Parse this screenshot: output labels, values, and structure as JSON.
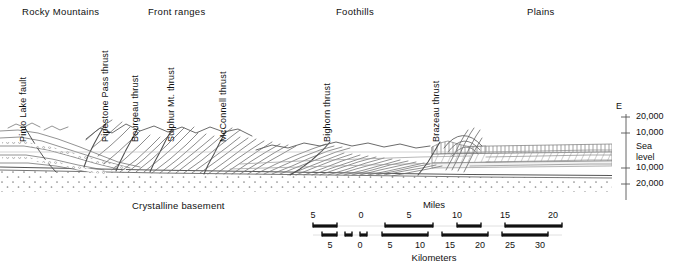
{
  "figure": {
    "type": "geological-cross-section",
    "title_regions": [
      {
        "label": "Rocky Mountains",
        "x": 22,
        "y": 6
      },
      {
        "label": "Front ranges",
        "x": 148,
        "y": 6
      },
      {
        "label": "Foothills",
        "x": 336,
        "y": 6
      },
      {
        "label": "Plains",
        "x": 527,
        "y": 6
      }
    ],
    "fault_labels": [
      {
        "label": "Pinto Lake fault",
        "x": 28,
        "y": 132
      },
      {
        "label": "Pipestone Pass thrust",
        "x": 110,
        "y": 132
      },
      {
        "label": "Bourgeau thrust",
        "x": 140,
        "y": 132
      },
      {
        "label": "Sulphur Mt. thrust",
        "x": 176,
        "y": 132
      },
      {
        "label": "McConnell thrust",
        "x": 228,
        "y": 132
      },
      {
        "label": "Bighorn thrust",
        "x": 332,
        "y": 132
      },
      {
        "label": "Brazeau thrust",
        "x": 441,
        "y": 132
      }
    ],
    "basement_label": {
      "label": "Crystalline basement",
      "x": 132,
      "y": 200
    },
    "elevation_axis": {
      "direction_label": "E",
      "direction_x": 616,
      "direction_y": 101,
      "axis_x": 626,
      "axis_top": 114,
      "axis_bottom": 200,
      "ticks": [
        {
          "label": "20,000",
          "y": 117
        },
        {
          "label": "10,000",
          "y": 133
        },
        {
          "label": "Sea",
          "y": 147,
          "no_tick": true
        },
        {
          "label": "level",
          "y": 157,
          "no_tick": true
        },
        {
          "label": "10,000",
          "y": 168
        },
        {
          "label": "20,000",
          "y": 184
        }
      ],
      "sea_level_y": 152
    },
    "scale_bar": {
      "miles_title": "Miles",
      "kilometers_title": "Kilometers",
      "miles_title_x": 434,
      "miles_title_y": 199,
      "km_title_x": 434,
      "km_title_y": 252,
      "bar_left": 313,
      "bar_right": 562,
      "miles_row_y": 226,
      "km_row_y": 235,
      "miles_labels": [
        {
          "text": "5",
          "x": 313
        },
        {
          "text": "0",
          "x": 361
        },
        {
          "text": "5",
          "x": 409
        },
        {
          "text": "10",
          "x": 457
        },
        {
          "text": "15",
          "x": 505
        },
        {
          "text": "20",
          "x": 553
        }
      ],
      "miles_label_y": 210,
      "km_labels": [
        {
          "text": "5",
          "x": 330
        },
        {
          "text": "0",
          "x": 360
        },
        {
          "text": "5",
          "x": 390
        },
        {
          "text": "10",
          "x": 420
        },
        {
          "text": "15",
          "x": 450
        },
        {
          "text": "20",
          "x": 480
        },
        {
          "text": "25",
          "x": 510
        },
        {
          "text": "30",
          "x": 540
        }
      ],
      "km_label_y": 240,
      "miles_segments": [
        {
          "x1": 313,
          "x2": 337
        },
        {
          "x1": 385,
          "x2": 433
        },
        {
          "x1": 457,
          "x2": 481
        },
        {
          "x1": 505,
          "x2": 562
        }
      ],
      "km_segments": [
        {
          "x1": 322,
          "x2": 337
        },
        {
          "x1": 345,
          "x2": 352
        },
        {
          "x1": 360,
          "x2": 367
        },
        {
          "x1": 382,
          "x2": 428
        },
        {
          "x1": 442,
          "x2": 488
        },
        {
          "x1": 502,
          "x2": 548
        }
      ]
    },
    "colors": {
      "ink": "#6b6b6b",
      "ink_dark": "#444444",
      "text": "#111111",
      "paper": "#ffffff",
      "stipple": "#8a8a8a"
    },
    "section": {
      "left": 0,
      "right": 612,
      "sea_level_y": 152,
      "basement_top_y": 176,
      "surface_note": "imbricate thrust sheets dipping west, flattening eastward into plains"
    }
  }
}
